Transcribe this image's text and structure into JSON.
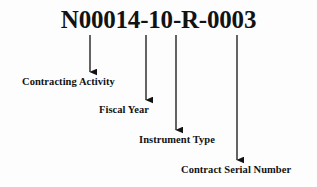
{
  "diagram": {
    "title_text": "N00014-10-R-0003",
    "ink_color": "#121212",
    "background_color": "#fdfdfd",
    "segments": [
      {
        "label": "Contracting Activity",
        "code_part": "N00014",
        "arrow_x": 90,
        "arrow_top": 35,
        "arrow_bottom": 72,
        "label_x": 22,
        "label_y": 75
      },
      {
        "label": "Fiscal Year",
        "code_part": "10",
        "arrow_x": 146,
        "arrow_top": 35,
        "arrow_bottom": 100,
        "label_x": 99,
        "label_y": 103
      },
      {
        "label": "Instrument Type",
        "code_part": "R",
        "arrow_x": 176,
        "arrow_top": 35,
        "arrow_bottom": 130,
        "label_x": 139,
        "label_y": 133
      },
      {
        "label": "Contract Serial Number",
        "code_part": "0003",
        "arrow_x": 237,
        "arrow_top": 35,
        "arrow_bottom": 160,
        "label_x": 181,
        "label_y": 163
      }
    ]
  }
}
